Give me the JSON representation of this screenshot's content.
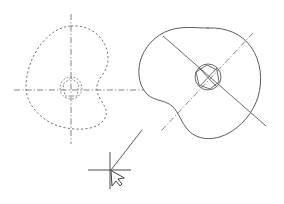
{
  "canvas": {
    "title": "CAD viewport",
    "width": 284,
    "height": 204,
    "background_color": "#ffffff",
    "line_color": "#5c5c60",
    "construction_color": "#74747a",
    "cursor_color": "#3c3c42"
  },
  "figures": {
    "left": {
      "name": "Cam profile - construction view",
      "line_style": "dashed",
      "center": {
        "x": 71,
        "y": 90
      },
      "outline_path": "M 71,26 C 86,25 98,32 104,43 C 110,54 109,66 103,74 C 99,80 96,84 97,90 C 98,98 104,103 106,110 C 108,118 101,126 90,128 C 76,131 58,128 46,120 C 33,111 26,99 26,87 C 26,72 32,55 42,43 C 51,32 60,27 71,26 Z",
      "vertical_centerline": {
        "x": 71,
        "y1": 14,
        "y2": 144
      },
      "horizontal_centerline": {
        "y": 90,
        "x1": 14,
        "x2": 143
      },
      "hub_circle": {
        "cx": 71,
        "cy": 88,
        "r": 11
      },
      "hub_polygon": "M 71,78 L 79,84 L 77,96 L 65,96 L 63,84 Z"
    },
    "right": {
      "name": "Cam profile - finished view",
      "line_style": "solid",
      "center": {
        "x": 208,
        "y": 77
      },
      "outline_path": "M 208,28 C 226,27 242,34 251,47 C 261,61 263,80 258,97 C 253,113 241,127 227,134 C 213,141 198,140 189,131 C 181,123 179,112 172,106 C 165,100 155,101 148,95 C 140,88 137,75 140,62 C 144,47 155,35 170,30 C 182,26 196,28 208,28 Z",
      "centerline_solid": {
        "x1": 163,
        "y1": 36,
        "x2": 266,
        "y2": 126
      },
      "centerline_dashdot": {
        "x1": 253,
        "y1": 33,
        "x2": 161,
        "y2": 131
      },
      "hub_circle": {
        "cx": 208,
        "cy": 77,
        "r": 13
      },
      "hub_polygon": "M 207,65 L 217,70 L 219,82 L 210,89 L 199,85 L 196,72 Z",
      "hub_cross_a": {
        "x1": 199,
        "y1": 68,
        "x2": 217,
        "y2": 87
      },
      "hub_cross_b": {
        "x1": 217,
        "y1": 68,
        "x2": 199,
        "y2": 87
      }
    }
  },
  "cursor": {
    "name": "CAD crosshair cursor",
    "position": {
      "x": 110,
      "y": 170
    },
    "crosshair_horizontal": {
      "y": 170,
      "x1": 88,
      "x2": 131
    },
    "crosshair_vertical": {
      "x": 110,
      "y1": 152,
      "y2": 189
    },
    "pointer_path": "M 111,171 L 112,186 L 116,181 L 120,186 L 122,184 L 118,179 L 124,178 Z",
    "leader_line": {
      "x1": 111,
      "y1": 170,
      "x2": 142,
      "y2": 130
    }
  }
}
